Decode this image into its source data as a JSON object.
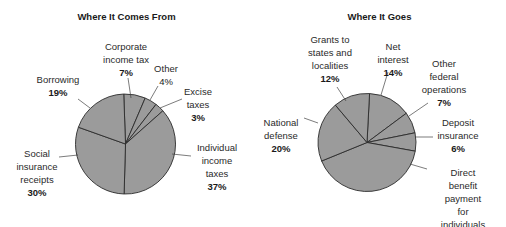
{
  "chart_data": [
    {
      "type": "pie",
      "title": "Where It Comes From",
      "start_angle_deg": -2,
      "direction": "clockwise",
      "slices": [
        {
          "label": "Corporate income tax",
          "value": 7
        },
        {
          "label": "Other",
          "value": 4
        },
        {
          "label": "Excise taxes",
          "value": 3
        },
        {
          "label": "Individual income taxes",
          "value": 37
        },
        {
          "label": "Social insurance receipts",
          "value": 30
        },
        {
          "label": "Borrowing",
          "value": 19
        }
      ],
      "fill": "#9b9b9b",
      "stroke": "#2b2b2b"
    },
    {
      "type": "pie",
      "title": "Where It Goes",
      "start_angle_deg": 3,
      "direction": "clockwise",
      "slices": [
        {
          "label": "Net interest",
          "value": 14
        },
        {
          "label": "Other federal operations",
          "value": 7
        },
        {
          "label": "Deposit insurance",
          "value": 6
        },
        {
          "label": "Direct benefit payment for individuals",
          "value": 41
        },
        {
          "label": "National defense",
          "value": 20
        },
        {
          "label": "Grants to states and localities",
          "value": 12
        }
      ],
      "fill": "#9b9b9b",
      "stroke": "#2b2b2b"
    }
  ],
  "left": {
    "title": "Where It Comes From",
    "labels": [
      {
        "name": "Corporate\nincome tax",
        "pct": "7%"
      },
      {
        "name": "Other",
        "pct": "4%"
      },
      {
        "name": "Excise\ntaxes",
        "pct": "3%"
      },
      {
        "name": "Individual\nincome\ntaxes",
        "pct": "37%"
      },
      {
        "name": "Social\ninsurance\nreceipts",
        "pct": "30%"
      },
      {
        "name": "Borrowing",
        "pct": "19%"
      }
    ]
  },
  "right": {
    "title": "Where It Goes",
    "labels": [
      {
        "name": "Net\ninterest",
        "pct": "14%"
      },
      {
        "name": "Other\nfederal\noperations",
        "pct": "7%"
      },
      {
        "name": "Deposit\ninsurance",
        "pct": "6%"
      },
      {
        "name": "Direct benefit\npayment for\nindividuals",
        "pct": "41%"
      },
      {
        "name": "National\ndefense",
        "pct": "20%"
      },
      {
        "name": "Grants to\nstates and\nlocalities",
        "pct": "12%"
      }
    ]
  }
}
